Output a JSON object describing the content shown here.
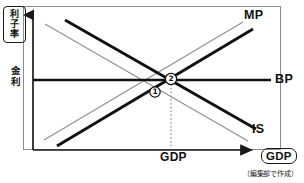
{
  "figure": {
    "title_axis_y_boxed": [
      "利",
      "子",
      "率"
    ],
    "axis_y_inline": [
      "金",
      "利"
    ],
    "axis_x_tick_label": "GDP",
    "axis_x_boxed_label": "GDP",
    "credit": "（編集部で作成）",
    "curves": [
      {
        "id": "mp",
        "label": "MP",
        "slope": "upward",
        "style": "thick-black",
        "color": "#111111",
        "x1": 57,
        "y1": 146,
        "x2": 253,
        "y2": 29
      },
      {
        "id": "mp-shift",
        "label": "",
        "slope": "upward",
        "style": "thin-gray",
        "color": "#8a8a8a",
        "x1": 44,
        "y1": 140,
        "x2": 243,
        "y2": 22
      },
      {
        "id": "bp",
        "label": "BP",
        "slope": "flat",
        "style": "thick-black",
        "color": "#111111",
        "x1": 33,
        "y1": 80,
        "x2": 271,
        "y2": 80
      },
      {
        "id": "is",
        "label": "IS",
        "slope": "downward",
        "style": "thick-black",
        "color": "#111111",
        "x1": 65,
        "y1": 20,
        "x2": 256,
        "y2": 129
      },
      {
        "id": "is-shift",
        "label": "",
        "slope": "downward",
        "style": "thin-gray",
        "color": "#8a8a8a",
        "x1": 45,
        "y1": 24,
        "x2": 248,
        "y2": 141
      }
    ],
    "points": [
      {
        "id": "point-1",
        "label": "1",
        "x": 155,
        "y": 92
      },
      {
        "id": "point-2",
        "label": "2",
        "x": 171,
        "y": 79
      }
    ],
    "guideline": {
      "x": 171,
      "y_top": 83,
      "y_bottom": 148
    },
    "colors": {
      "axis": "#1a1a1a",
      "curve_primary": "#111111",
      "curve_secondary": "#8a8a8a",
      "frame": "#8c8c8c",
      "background": "#ffffff"
    }
  }
}
